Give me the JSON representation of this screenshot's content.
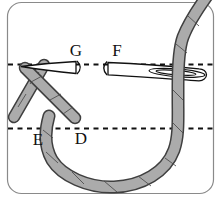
{
  "figure": {
    "type": "embroidery-stitch-step-diagram",
    "labels": {
      "g": "G",
      "f": "F",
      "e": "E",
      "d": "D"
    },
    "colors": {
      "thread_fill": "#ababab",
      "thread_outline": "#3f3f3f",
      "needle_fill": "#ffffff",
      "needle_outline": "#111111",
      "guide_line": "#111111",
      "border": "#8a8a8a",
      "background": "#ffffff"
    }
  }
}
